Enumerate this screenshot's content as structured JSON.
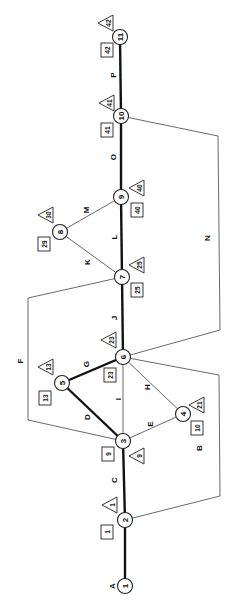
{
  "diagram": {
    "type": "network-activity-diagram",
    "orientation": "rotated-90-ccw",
    "nodes": [
      {
        "id": "1",
        "label": "1",
        "x": 125,
        "y": 586
      },
      {
        "id": "2",
        "label": "2",
        "x": 125,
        "y": 520
      },
      {
        "id": "3",
        "label": "3",
        "x": 123,
        "y": 441
      },
      {
        "id": "4",
        "label": "4",
        "x": 183,
        "y": 414
      },
      {
        "id": "5",
        "label": "5",
        "x": 62,
        "y": 383
      },
      {
        "id": "6",
        "label": "6",
        "x": 123,
        "y": 357
      },
      {
        "id": "7",
        "label": "7",
        "x": 122,
        "y": 277
      },
      {
        "id": "8",
        "label": "8",
        "x": 60,
        "y": 232
      },
      {
        "id": "9",
        "label": "9",
        "x": 121,
        "y": 197
      },
      {
        "id": "10",
        "label": "10",
        "x": 121,
        "y": 116
      },
      {
        "id": "11",
        "label": "11",
        "x": 120,
        "y": 37
      }
    ],
    "activities": [
      {
        "id": "A",
        "label": "A",
        "from": "1",
        "to": "2",
        "critical": true,
        "points": "125,586 125,520",
        "lx": 112,
        "ly": 586
      },
      {
        "id": "C",
        "label": "C",
        "from": "2",
        "to": "3",
        "critical": true,
        "points": "125,520 123,441",
        "lx": 114,
        "ly": 480
      },
      {
        "id": "B",
        "label": "B",
        "from": "2",
        "to": "6",
        "critical": false,
        "points": "125,520 220,496 219,375 123,357",
        "lx": 199,
        "ly": 448
      },
      {
        "id": "D",
        "label": "D",
        "from": "3",
        "to": "5",
        "critical": true,
        "points": "123,441 62,383",
        "lx": 87,
        "ly": 417
      },
      {
        "id": "E",
        "label": "E",
        "from": "3",
        "to": "4",
        "critical": false,
        "points": "123,441 183,414",
        "lx": 150,
        "ly": 424
      },
      {
        "id": "F",
        "label": "F",
        "from": "3",
        "to": "7",
        "critical": false,
        "points": "123,441 28,420 28,298 122,277",
        "lx": 20,
        "ly": 361
      },
      {
        "id": "I",
        "label": "I",
        "from": "3",
        "to": "6",
        "critical": false,
        "points": "123,441 123,357",
        "lx": 118,
        "ly": 399
      },
      {
        "id": "G",
        "label": "G",
        "from": "5",
        "to": "6",
        "critical": true,
        "points": "62,383 123,357",
        "lx": 86,
        "ly": 364
      },
      {
        "id": "H",
        "label": "H",
        "from": "4",
        "to": "6",
        "critical": false,
        "points": "183,414 123,357",
        "lx": 147,
        "ly": 387
      },
      {
        "id": "J",
        "label": "J",
        "from": "6",
        "to": "7",
        "critical": true,
        "points": "123,357 122,277",
        "lx": 114,
        "ly": 318
      },
      {
        "id": "N",
        "label": "N",
        "from": "6",
        "to": "10",
        "critical": false,
        "points": "123,357 220,330 218,136 121,116",
        "lx": 207,
        "ly": 238
      },
      {
        "id": "K",
        "label": "K",
        "from": "7",
        "to": "8",
        "critical": false,
        "points": "122,277 60,232",
        "lx": 87,
        "ly": 262
      },
      {
        "id": "L",
        "label": "L",
        "from": "7",
        "to": "9",
        "critical": true,
        "points": "122,277 121,197",
        "lx": 114,
        "ly": 237
      },
      {
        "id": "M",
        "label": "M",
        "from": "8",
        "to": "9",
        "critical": false,
        "points": "60,232 121,197",
        "lx": 86,
        "ly": 210
      },
      {
        "id": "O",
        "label": "O",
        "from": "9",
        "to": "10",
        "critical": true,
        "points": "121,197 121,116",
        "lx": 113,
        "ly": 157
      },
      {
        "id": "P",
        "label": "P",
        "from": "10",
        "to": "11",
        "critical": true,
        "points": "121,116 120,37",
        "lx": 113,
        "ly": 75
      }
    ],
    "earliest_times": [
      {
        "node": "2",
        "value": "1",
        "x": 107,
        "y": 532
      },
      {
        "node": "3",
        "value": "9",
        "x": 108,
        "y": 454
      },
      {
        "node": "4",
        "value": "10",
        "x": 197,
        "y": 428
      },
      {
        "node": "5",
        "value": "13",
        "x": 45,
        "y": 398
      },
      {
        "node": "6",
        "value": "23",
        "x": 110,
        "y": 375
      },
      {
        "node": "7",
        "value": "25",
        "x": 137,
        "y": 290
      },
      {
        "node": "8",
        "value": "29",
        "x": 44,
        "y": 244
      },
      {
        "node": "9",
        "value": "40",
        "x": 137,
        "y": 210
      },
      {
        "node": "10",
        "value": "41",
        "x": 107,
        "y": 130
      },
      {
        "node": "11",
        "value": "42",
        "x": 107,
        "y": 50
      }
    ],
    "latest_times": [
      {
        "node": "2",
        "value": "1",
        "x": 111,
        "y": 505
      },
      {
        "node": "3",
        "value": "9",
        "x": 138,
        "y": 456
      },
      {
        "node": "4",
        "value": "21",
        "x": 198,
        "y": 405
      },
      {
        "node": "5",
        "value": "13",
        "x": 47,
        "y": 367
      },
      {
        "node": "6",
        "value": "23",
        "x": 110,
        "y": 340
      },
      {
        "node": "7",
        "value": "25",
        "x": 138,
        "y": 265
      },
      {
        "node": "8",
        "value": "30",
        "x": 47,
        "y": 215
      },
      {
        "node": "9",
        "value": "40",
        "x": 138,
        "y": 188
      },
      {
        "node": "10",
        "value": "41",
        "x": 108,
        "y": 103
      },
      {
        "node": "11",
        "value": "42",
        "x": 107,
        "y": 23
      }
    ]
  }
}
